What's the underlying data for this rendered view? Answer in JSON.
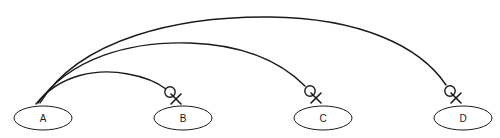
{
  "diagram": {
    "width": 500,
    "height": 138,
    "background_color": "#ffffff",
    "stroke_color": "#1a1a1a",
    "node_fill_color": "#ffffff",
    "nodes": [
      {
        "id": "A",
        "label": "A",
        "cx": 43,
        "cy": 118,
        "rx": 29,
        "ry": 12
      },
      {
        "id": "B",
        "label": "B",
        "cx": 183,
        "cy": 118,
        "rx": 29,
        "ry": 12
      },
      {
        "id": "C",
        "label": "C",
        "cx": 323,
        "cy": 118,
        "rx": 29,
        "ry": 12
      },
      {
        "id": "D",
        "label": "D",
        "cx": 463,
        "cy": 118,
        "rx": 29,
        "ry": 12
      }
    ],
    "edges": [
      {
        "id": "edge-a-b",
        "from": "A",
        "to": "B",
        "marker": "circle-x-marker",
        "path": "M 36,104 C 60,74 98,68 128,74 C 145,77 158,83 166,89",
        "marker_cx": 170,
        "marker_cy": 92,
        "marker_r": 5.2,
        "x_cx": 176,
        "x_cy": 99,
        "x_half": 5
      },
      {
        "id": "edge-a-c",
        "from": "A",
        "to": "C",
        "marker": "circle-x-marker",
        "path": "M 38,103 C 70,58 130,41 190,43 C 250,45 285,66 305,86",
        "marker_cx": 310,
        "marker_cy": 91,
        "marker_r": 5.2,
        "x_cx": 316,
        "x_cy": 98,
        "x_half": 5
      },
      {
        "id": "edge-a-d",
        "from": "A",
        "to": "D",
        "marker": "circle-x-marker",
        "path": "M 40,103 C 80,38 180,16 270,17 C 360,18 420,46 446,85",
        "marker_cx": 450,
        "marker_cy": 91,
        "marker_r": 5.2,
        "x_cx": 456,
        "x_cy": 98,
        "x_half": 5
      }
    ]
  }
}
